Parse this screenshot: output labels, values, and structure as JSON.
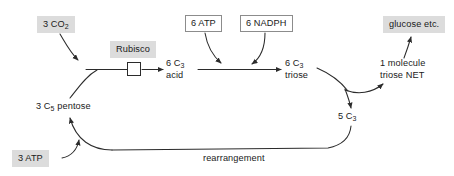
{
  "diagram": {
    "canvas": {
      "width": 454,
      "height": 176
    },
    "colors": {
      "background": "#ffffff",
      "shaded_label_fill": "#dcdcdc",
      "boxed_label_fill": "#ffffff",
      "boxed_label_border": "#8c8c8c",
      "stroke": "#2b2b2b",
      "text": "#1a1a1a"
    },
    "nodes": {
      "co2": {
        "label": "3 CO",
        "sub": "2",
        "style": "shaded"
      },
      "rubisco": {
        "label": "Rubisco",
        "style": "shaded"
      },
      "atp_top": {
        "label": "6 ATP",
        "style": "boxed"
      },
      "nadph_top": {
        "label": "6 NADPH",
        "style": "boxed"
      },
      "glucose": {
        "label": "glucose etc.",
        "style": "shaded"
      },
      "c3_acid": {
        "line1_pre": "6 C",
        "line1_sub": "3",
        "line2": "acid",
        "style": "plain"
      },
      "c3_triose": {
        "line1_pre": "6 C",
        "line1_sub": "3",
        "line2": "triose",
        "style": "plain"
      },
      "net_triose": {
        "line1": "1 molecule",
        "line2": "triose NET",
        "style": "plain"
      },
      "c3_five": {
        "label": "5 C",
        "sub": "3",
        "style": "plain"
      },
      "c5_pentose": {
        "pre": "3 C",
        "sub": "5",
        "post": " pentose",
        "style": "plain"
      },
      "atp_bottom": {
        "label": "3 ATP",
        "style": "shaded"
      },
      "rearrangement": {
        "label": "rearrangement",
        "style": "plain"
      }
    },
    "edges": [
      {
        "name": "co2-to-junction",
        "from": "co2",
        "to": "carboxylation-junction",
        "arrow": true
      },
      {
        "name": "pentose-to-junction",
        "from": "c5_pentose",
        "to": "carboxylation-junction",
        "arrow": false
      },
      {
        "name": "junction-to-c3acid",
        "from": "carboxylation-junction",
        "to": "c3_acid",
        "arrow": true,
        "enzyme": "rubisco"
      },
      {
        "name": "c3acid-to-c3triose",
        "from": "c3_acid",
        "to": "c3_triose",
        "arrow": true
      },
      {
        "name": "atp-into-reduction",
        "from": "atp_top",
        "to": "c3acid-to-c3triose",
        "arrow": true
      },
      {
        "name": "nadph-into-reduction",
        "from": "nadph_top",
        "to": "c3acid-to-c3triose",
        "arrow": true
      },
      {
        "name": "c3triose-to-branch",
        "from": "c3_triose",
        "to": "branch-point",
        "arrow": false
      },
      {
        "name": "branch-to-net",
        "from": "branch-point",
        "to": "net_triose",
        "arrow": true
      },
      {
        "name": "branch-to-5c3",
        "from": "branch-point",
        "to": "c3_five",
        "arrow": true
      },
      {
        "name": "net-to-glucose",
        "from": "net_triose",
        "to": "glucose",
        "arrow": true
      },
      {
        "name": "5c3-rearrangement-return",
        "from": "c3_five",
        "to": "pentose-regeneration",
        "arrow": false,
        "label": "rearrangement"
      },
      {
        "name": "regeneration-to-pentose",
        "from": "pentose-regeneration",
        "to": "c5_pentose",
        "arrow": true
      },
      {
        "name": "atp-into-regeneration",
        "from": "atp_bottom",
        "to": "pentose-regeneration",
        "arrow": true
      }
    ]
  }
}
